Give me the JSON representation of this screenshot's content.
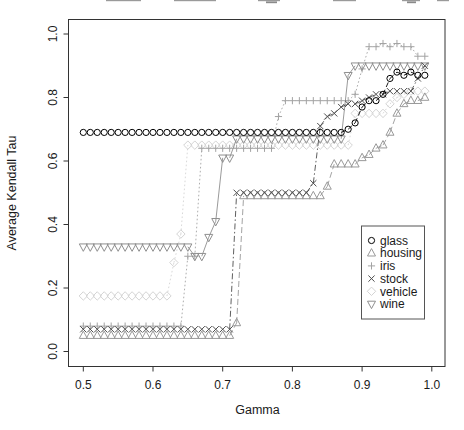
{
  "figure": {
    "background": "#ffffff",
    "axis_color": "#333333",
    "x_axis": {
      "title": "Gamma",
      "ticks": [
        "0.5",
        "0.6",
        "0.7",
        "0.8",
        "0.9",
        "1.0"
      ]
    },
    "y_axis": {
      "title": "Average Kendall Tau",
      "ticks": [
        "0.0",
        "0.2",
        "0.4",
        "0.6",
        "0.8",
        "1.0"
      ]
    },
    "cropped_title_marks": [
      [
        106,
        141
      ],
      [
        174,
        216
      ],
      [
        258,
        280
      ],
      [
        333,
        356
      ],
      [
        402,
        420
      ],
      [
        437,
        449
      ]
    ],
    "cropped_title_descender_marks": [
      [
        266,
        277
      ],
      [
        407,
        416
      ]
    ]
  },
  "legend": {
    "entries": [
      {
        "label": "glass",
        "marker": "circle-icon",
        "color": "#000000"
      },
      {
        "label": "housing",
        "marker": "triangle-up-icon",
        "color": "#999999"
      },
      {
        "label": "iris",
        "marker": "plus-icon",
        "color": "#a3a3a3"
      },
      {
        "label": "stock",
        "marker": "x-icon",
        "color": "#4d4d4d"
      },
      {
        "label": "vehicle",
        "marker": "diamond-icon",
        "color": "#d4d4d4"
      },
      {
        "label": "wine",
        "marker": "triangle-down-icon",
        "color": "#8f8f8f"
      }
    ]
  },
  "chart_data": {
    "type": "scatter",
    "title": "",
    "xlabel": "Gamma",
    "ylabel": "Average Kendall Tau",
    "xlim": [
      0.5,
      1.0
    ],
    "ylim": [
      0.0,
      1.0
    ],
    "grid": false,
    "legend_position": "lower-right",
    "x_start": 0.5,
    "x_step": 0.01,
    "series": [
      {
        "name": "glass",
        "marker": "circle",
        "color": "#000000",
        "dash": "5 3",
        "values": [
          0.69,
          0.69,
          0.69,
          0.69,
          0.69,
          0.69,
          0.69,
          0.69,
          0.69,
          0.69,
          0.69,
          0.69,
          0.69,
          0.69,
          0.69,
          0.69,
          0.69,
          0.69,
          0.69,
          0.69,
          0.69,
          0.69,
          0.69,
          0.69,
          0.69,
          0.69,
          0.69,
          0.69,
          0.69,
          0.69,
          0.69,
          0.69,
          0.69,
          0.69,
          0.69,
          0.69,
          0.69,
          0.69,
          0.7,
          0.72,
          0.77,
          0.79,
          0.79,
          0.81,
          0.86,
          0.88,
          0.87,
          0.88,
          0.87,
          0.87
        ]
      },
      {
        "name": "housing",
        "marker": "triangle-up",
        "color": "#999999",
        "dash": "6 3",
        "values": [
          0.05,
          0.05,
          0.05,
          0.05,
          0.05,
          0.05,
          0.05,
          0.05,
          0.05,
          0.05,
          0.05,
          0.05,
          0.05,
          0.05,
          0.05,
          0.05,
          0.05,
          0.05,
          0.05,
          0.05,
          0.05,
          0.05,
          0.09,
          0.49,
          0.49,
          0.49,
          0.49,
          0.49,
          0.49,
          0.49,
          0.49,
          0.49,
          0.49,
          0.49,
          0.49,
          0.52,
          0.59,
          0.59,
          0.59,
          0.59,
          0.61,
          0.62,
          0.64,
          0.65,
          0.69,
          0.75,
          0.78,
          0.79,
          0.79,
          0.8
        ]
      },
      {
        "name": "iris",
        "marker": "plus",
        "color": "#a3a3a3",
        "dash": "1.6 2.4",
        "values": [
          0.08,
          0.08,
          0.08,
          0.08,
          0.08,
          0.08,
          0.08,
          0.08,
          0.08,
          0.08,
          0.08,
          0.08,
          0.08,
          0.08,
          0.08,
          0.3,
          0.3,
          0.64,
          0.64,
          0.64,
          0.64,
          0.64,
          0.64,
          0.64,
          0.64,
          0.64,
          0.64,
          0.64,
          0.74,
          0.79,
          0.79,
          0.79,
          0.79,
          0.79,
          0.79,
          0.79,
          0.79,
          0.79,
          0.79,
          0.81,
          0.89,
          0.96,
          0.96,
          0.97,
          0.96,
          0.97,
          0.96,
          0.96,
          0.93,
          0.93
        ]
      },
      {
        "name": "stock",
        "marker": "x",
        "color": "#4d4d4d",
        "dash": "6 2.5 1.5 2.5",
        "values": [
          0.07,
          0.07,
          0.07,
          0.07,
          0.07,
          0.07,
          0.07,
          0.07,
          0.07,
          0.07,
          0.07,
          0.07,
          0.07,
          0.07,
          0.07,
          0.07,
          0.07,
          0.07,
          0.07,
          0.07,
          0.07,
          0.07,
          0.5,
          0.5,
          0.5,
          0.5,
          0.5,
          0.5,
          0.5,
          0.5,
          0.5,
          0.5,
          0.5,
          0.53,
          0.71,
          0.74,
          0.75,
          0.77,
          0.78,
          0.78,
          0.79,
          0.8,
          0.81,
          0.81,
          0.82,
          0.82,
          0.82,
          0.82,
          0.86,
          0.9
        ]
      },
      {
        "name": "vehicle",
        "marker": "diamond",
        "color": "#d4d4d4",
        "dash": "1.6 2.4",
        "values": [
          0.175,
          0.175,
          0.175,
          0.175,
          0.175,
          0.175,
          0.175,
          0.175,
          0.175,
          0.175,
          0.175,
          0.175,
          0.175,
          0.28,
          0.37,
          0.65,
          0.65,
          0.65,
          0.65,
          0.65,
          0.65,
          0.65,
          0.65,
          0.65,
          0.65,
          0.65,
          0.65,
          0.65,
          0.65,
          0.65,
          0.65,
          0.65,
          0.65,
          0.65,
          0.65,
          0.65,
          0.65,
          0.65,
          0.65,
          0.75,
          0.75,
          0.75,
          0.75,
          0.75,
          0.78,
          0.8,
          0.81,
          0.82,
          0.82,
          0.82
        ]
      },
      {
        "name": "wine",
        "marker": "triangle-down",
        "color": "#8f8f8f",
        "dash": "",
        "values": [
          0.33,
          0.33,
          0.33,
          0.33,
          0.33,
          0.33,
          0.33,
          0.33,
          0.33,
          0.33,
          0.33,
          0.33,
          0.33,
          0.33,
          0.33,
          0.33,
          0.3,
          0.3,
          0.36,
          0.41,
          0.61,
          0.61,
          0.67,
          0.67,
          0.67,
          0.67,
          0.67,
          0.67,
          0.67,
          0.67,
          0.67,
          0.67,
          0.67,
          0.67,
          0.67,
          0.67,
          0.67,
          0.67,
          0.87,
          0.9,
          0.9,
          0.9,
          0.9,
          0.9,
          0.9,
          0.9,
          0.9,
          0.9,
          0.9,
          0.9
        ]
      }
    ]
  }
}
